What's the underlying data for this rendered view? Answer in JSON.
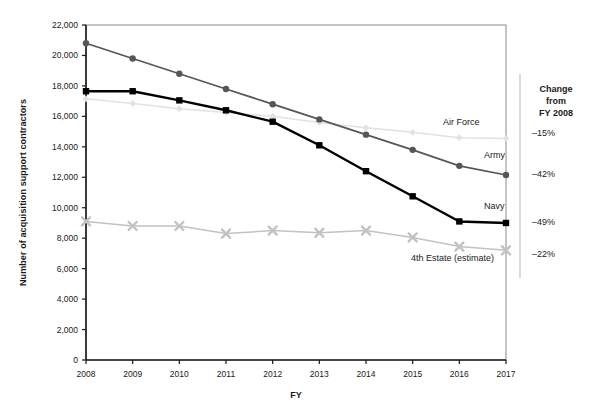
{
  "chart_data": {
    "type": "line",
    "title": "",
    "xlabel": "FY",
    "ylabel": "Number of acquisition support contractors",
    "categories": [
      "2008",
      "2009",
      "2010",
      "2011",
      "2012",
      "2013",
      "2014",
      "2015",
      "2016",
      "2017"
    ],
    "x": [
      2008,
      2009,
      2010,
      2011,
      2012,
      2013,
      2014,
      2015,
      2016,
      2017
    ],
    "ylim": [
      0,
      22000
    ],
    "yticks": [
      0,
      2000,
      4000,
      6000,
      8000,
      10000,
      12000,
      14000,
      16000,
      18000,
      20000,
      22000
    ],
    "ytick_labels": [
      "0",
      "2,000",
      "4,000",
      "6,000",
      "8,000",
      "10,000",
      "12,000",
      "14,000",
      "16,000",
      "18,000",
      "20,000",
      "22,000"
    ],
    "grid": false,
    "legend_position": "inline-right-end-of-series",
    "series": [
      {
        "name": "Army",
        "label": "Army",
        "color": "#565656",
        "marker": "circle",
        "change_from_fy2008": "–42%",
        "values": [
          20800,
          19800,
          18800,
          17800,
          16800,
          15800,
          14800,
          13800,
          12750,
          12150
        ]
      },
      {
        "name": "Navy",
        "label": "Navy",
        "color": "#000000",
        "marker": "square",
        "change_from_fy2008": "–49%",
        "values": [
          17650,
          17650,
          17050,
          16400,
          15650,
          14100,
          12400,
          10750,
          9100,
          9000
        ]
      },
      {
        "name": "Air Force",
        "label": "Air Force",
        "color": "#e2e2e2",
        "marker": "diamond",
        "change_from_fy2008": "–15%",
        "values": [
          17150,
          16850,
          16500,
          16250,
          16000,
          15600,
          15250,
          14950,
          14600,
          14550
        ]
      },
      {
        "name": "4th Estate (estimate)",
        "label": "4th Estate (estimate)",
        "color": "#c2c2c2",
        "marker": "x",
        "change_from_fy2008": "–22%",
        "values": [
          9100,
          8800,
          8800,
          8300,
          8500,
          8350,
          8500,
          8050,
          7450,
          7200
        ]
      }
    ],
    "change_panel": {
      "header_line1": "Change",
      "header_line2": "from",
      "header_line3": "FY 2008",
      "rows": [
        {
          "series": "Air Force",
          "value": "–15%"
        },
        {
          "series": "Army",
          "value": "–42%"
        },
        {
          "series": "Navy",
          "value": "–49%"
        },
        {
          "series": "4th Estate (estimate)",
          "value": "–22%"
        }
      ]
    }
  },
  "colors": {
    "axis": "#1a1a1a",
    "frame": "#8a8a8a",
    "army": "#565656",
    "navy": "#000000",
    "air_force": "#e2e2e2",
    "fourth_estate": "#c2c2c2",
    "background": "#ffffff"
  }
}
